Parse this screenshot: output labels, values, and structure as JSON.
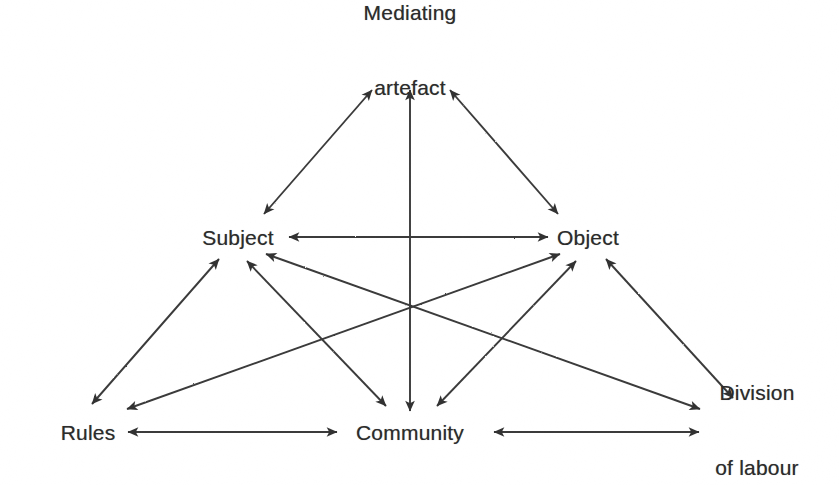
{
  "diagram": {
    "type": "activity-system-triangle",
    "background_color": "#ffffff",
    "line_color": "#3a3a3a",
    "text_color": "#2b2b2b",
    "nodes": [
      {
        "id": "mediating-artefact",
        "label_lines": [
          "Mediating",
          "artefact"
        ],
        "x": 410,
        "y": 50
      },
      {
        "id": "subject",
        "label_lines": [
          "Subject"
        ],
        "x": 238,
        "y": 237
      },
      {
        "id": "object",
        "label_lines": [
          "Object"
        ],
        "x": 588,
        "y": 237
      },
      {
        "id": "rules",
        "label_lines": [
          "Rules"
        ],
        "x": 88,
        "y": 432
      },
      {
        "id": "community",
        "label_lines": [
          "Community"
        ],
        "x": 410,
        "y": 432
      },
      {
        "id": "division-of-labour",
        "label_lines": [
          "Division",
          "of labour"
        ],
        "x": 757,
        "y": 430
      }
    ],
    "edges": [
      {
        "id": "subject-mediating-artefact",
        "from": "subject",
        "to": "mediating-artefact",
        "arrows": "both"
      },
      {
        "id": "object-mediating-artefact",
        "from": "object",
        "to": "mediating-artefact",
        "arrows": "both"
      },
      {
        "id": "community-mediating-artefact",
        "from": "community",
        "to": "mediating-artefact",
        "arrows": "both"
      },
      {
        "id": "subject-object",
        "from": "subject",
        "to": "object",
        "arrows": "both"
      },
      {
        "id": "rules-community",
        "from": "rules",
        "to": "community",
        "arrows": "both"
      },
      {
        "id": "community-division-of-labour",
        "from": "community",
        "to": "division-of-labour",
        "arrows": "both"
      },
      {
        "id": "subject-rules",
        "from": "subject",
        "to": "rules",
        "arrows": "both"
      },
      {
        "id": "subject-community",
        "from": "subject",
        "to": "community",
        "arrows": "both"
      },
      {
        "id": "subject-division-of-labour",
        "from": "subject",
        "to": "division-of-labour",
        "arrows": "both"
      },
      {
        "id": "object-community",
        "from": "object",
        "to": "community",
        "arrows": "both"
      },
      {
        "id": "object-rules",
        "from": "object",
        "to": "rules",
        "arrows": "both"
      },
      {
        "id": "object-division-of-labour",
        "from": "object",
        "to": "division-of-labour",
        "arrows": "both"
      }
    ]
  }
}
